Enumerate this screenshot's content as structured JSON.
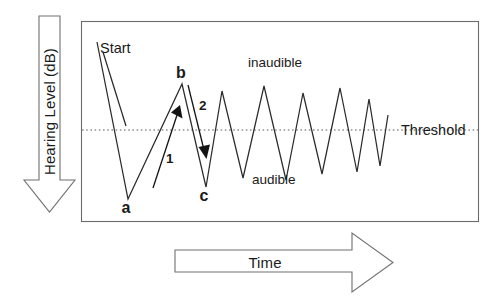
{
  "figure": {
    "kind": "bekesy-audiometry-tracing-diagram",
    "background_color": "#ffffff",
    "frame_color": "#6b6b6b",
    "trace_color": "#2b2b2b",
    "threshold_color": "#5a5a5a",
    "annotation_color": "#141414"
  },
  "axes": {
    "y_axis": {
      "label": "Hearing Level (dB)",
      "direction": "down",
      "arrow_name": "hearing-level-arrow"
    },
    "x_axis": {
      "label": "Time",
      "direction": "right",
      "arrow_name": "time-arrow"
    }
  },
  "plot": {
    "frame": {
      "x": 81,
      "y": 21,
      "width": 398,
      "height": 201
    },
    "threshold": {
      "label": "Threshold",
      "y": 130,
      "x_start": 82,
      "x_end": 478,
      "style": "dotted"
    },
    "regions": [
      {
        "id": "inaudible",
        "label": "inaudible",
        "position": "above-threshold",
        "x": 248,
        "y": 67
      },
      {
        "id": "audible",
        "label": "audible",
        "position": "below-threshold",
        "x": 252,
        "y": 184
      }
    ],
    "callouts": [
      {
        "id": "start",
        "label": "Start",
        "x": 100,
        "y": 48
      }
    ],
    "point_markers": [
      {
        "id": "a",
        "label": "a",
        "x": 126,
        "y": 208,
        "role": "first-valley"
      },
      {
        "id": "b",
        "label": "b",
        "x": 180,
        "y": 76,
        "role": "first-peak"
      },
      {
        "id": "c",
        "label": "c",
        "x": 203,
        "y": 196,
        "role": "second-valley"
      }
    ],
    "step_annotations": [
      {
        "id": "step-1",
        "label": "1",
        "x": 168,
        "y": 158,
        "direction": "up",
        "meaning": "subject presses button, level decreases toward audible"
      },
      {
        "id": "step-2",
        "label": "2",
        "x": 205,
        "y": 105,
        "direction": "down",
        "meaning": "subject releases button, level increases toward inaudible"
      }
    ],
    "trace_points": [
      [
        97,
        42
      ],
      [
        128,
        199
      ],
      [
        182,
        84
      ],
      [
        206,
        187
      ],
      [
        222,
        91
      ],
      [
        243,
        178
      ],
      [
        264,
        86
      ],
      [
        286,
        180
      ],
      [
        303,
        93
      ],
      [
        322,
        174
      ],
      [
        340,
        88
      ],
      [
        357,
        172
      ],
      [
        369,
        99
      ],
      [
        380,
        166
      ],
      [
        388,
        115
      ]
    ],
    "annotation_arrow_1": {
      "x1": 153,
      "y1": 188,
      "x2": 180,
      "y2": 106
    },
    "annotation_arrow_2": {
      "x1": 187,
      "y1": 83,
      "x2": 206,
      "y2": 158
    }
  }
}
